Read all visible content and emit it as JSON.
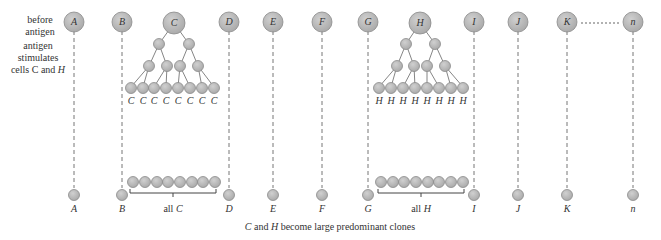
{
  "side_labels": {
    "before_line1": "before",
    "before_line2": "antigen",
    "stim_line1": "antigen",
    "stim_line2": "stimulates",
    "stim_line3a": "cells ",
    "stim_line3b": "C",
    "stim_line3c": " and ",
    "stim_line3d": "H"
  },
  "cells": [
    {
      "name": "A",
      "x": 74
    },
    {
      "name": "B",
      "x": 122
    },
    {
      "name": "C",
      "x": 174
    },
    {
      "name": "D",
      "x": 229
    },
    {
      "name": "E",
      "x": 273
    },
    {
      "name": "F",
      "x": 322
    },
    {
      "name": "G",
      "x": 368
    },
    {
      "name": "H",
      "x": 420
    },
    {
      "name": "I",
      "x": 474
    },
    {
      "name": "J",
      "x": 518
    },
    {
      "name": "K",
      "x": 567
    },
    {
      "name": "n",
      "x": 633
    }
  ],
  "bottom_labels": {
    "A": "A",
    "B": "B",
    "all_c_prefix": "all ",
    "all_c": "C",
    "D": "D",
    "E": "E",
    "F": "F",
    "G": "G",
    "all_h_prefix": "all ",
    "all_h": "H",
    "I": "I",
    "J": "J",
    "K": "K",
    "n": "n"
  },
  "leaf_labels": {
    "C": "C",
    "H": "H"
  },
  "caption": {
    "c": "C",
    "and": " and ",
    "h": "H",
    "rest": " become large predominant clones"
  },
  "colors": {
    "cell_fill": "#b8b8b8",
    "cell_stroke": "#8a8a8a",
    "line": "#777777",
    "text": "#333333"
  }
}
